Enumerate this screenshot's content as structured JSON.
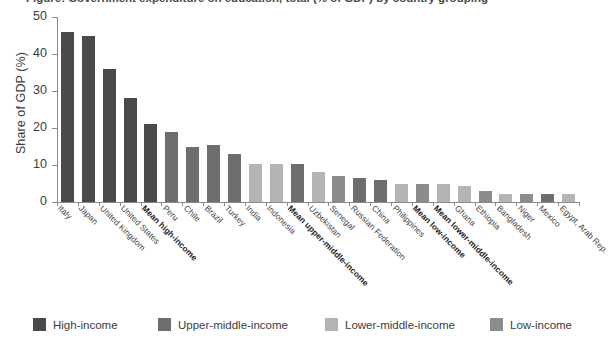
{
  "figure": {
    "title_cropped": "Figure: Government expenditure on education, total (% of GDP) by country grouping",
    "y_axis_label": "Share of GDP (%)"
  },
  "chart_data": {
    "type": "bar",
    "title": "",
    "xlabel": "",
    "ylabel": "Share of GDP (%)",
    "ylim": [
      0,
      50
    ],
    "yticks": [
      0,
      10,
      20,
      30,
      40,
      50
    ],
    "grid": false,
    "legend_position": "bottom",
    "categories": [
      "Italy",
      "Japan",
      "United Kingdom",
      "United States",
      "Mean high-income",
      "Peru",
      "Chile",
      "Brazil",
      "Turkey",
      "India",
      "Indonesia",
      "Mean upper-middle-income",
      "Uzbekistan",
      "Senegal",
      "Russian Federation",
      "China",
      "Philippines",
      "Mean low-income",
      "Mean lower-middle-income",
      "Ghana",
      "Ethiopia",
      "Bangladesh",
      "Niger",
      "Mexico",
      "Egypt, Arab Rep."
    ],
    "values": [
      46.0,
      45.0,
      36.0,
      28.0,
      21.0,
      19.0,
      15.0,
      15.3,
      13.0,
      10.2,
      10.2,
      10.3,
      8.0,
      7.0,
      6.5,
      6.0,
      5.0,
      5.0,
      5.0,
      4.2,
      3.0,
      2.2,
      2.2,
      2.2,
      2.2
    ],
    "group_of_bar": [
      "high-income",
      "high-income",
      "high-income",
      "high-income",
      "high-income",
      "upper-middle-income",
      "upper-middle-income",
      "upper-middle-income",
      "upper-middle-income",
      "lower-middle-income",
      "lower-middle-income",
      "upper-middle-income",
      "lower-middle-income",
      "low-income",
      "upper-middle-income",
      "upper-middle-income",
      "lower-middle-income",
      "low-income",
      "lower-middle-income",
      "lower-middle-income",
      "low-income",
      "lower-middle-income",
      "low-income",
      "upper-middle-income",
      "lower-middle-income"
    ],
    "bold_labels": [
      "Mean high-income",
      "Mean upper-middle-income",
      "Mean low-income",
      "Mean lower-middle-income"
    ],
    "legend": [
      {
        "label": "High-income",
        "color": "#4a4a4a"
      },
      {
        "label": "Upper-middle-income",
        "color": "#6e6e6e"
      },
      {
        "label": "Lower-middle-income",
        "color": "#b4b4b4"
      },
      {
        "label": "Low-income",
        "color": "#8c8c8c"
      }
    ],
    "colors": {
      "high-income": "#4a4a4a",
      "upper-middle-income": "#6e6e6e",
      "lower-middle-income": "#b4b4b4",
      "low-income": "#8c8c8c",
      "axis": "#8a8a8a",
      "text": "#3c3c3c"
    }
  }
}
